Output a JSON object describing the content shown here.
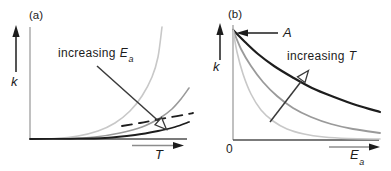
{
  "colors": {
    "light_curve": "#c8c8c8",
    "mid_curve": "#9a9a9a",
    "dark_curve": "#1d1d1d",
    "y_axis": "#9e9e9e",
    "x_axis": "#4f4f4f",
    "indicator": "#1d1d1d",
    "guide_shaft": "#8c8c8c",
    "annotation_arrow": "#3a3a3a",
    "text": "#1c1c1c",
    "background": "#ffffff"
  },
  "panel_a": {
    "tag": "(a)",
    "y_axis_label": "k",
    "x_axis_label": "T",
    "annotation": {
      "text": "increasing",
      "symbol": "E",
      "subscript": "a"
    }
  },
  "panel_b": {
    "tag": "(b)",
    "y_axis_label": "k",
    "x_axis_label": "E",
    "x_axis_subscript": "a",
    "origin_label": "0",
    "intercept_label": "A",
    "annotation": {
      "text": "increasing",
      "symbol": "T"
    }
  },
  "chart_data": [
    {
      "type": "line",
      "panel": "(a)",
      "title": "rate constant k versus temperature T for different activation energies",
      "xlabel": "T",
      "ylabel": "k",
      "numeric_axes": false,
      "annotation": "increasing Ea (arrow toward flatter curves)",
      "legend": "none",
      "series": [
        {
          "name": "smallest Ea",
          "color": "light",
          "width": 1.6,
          "dashed": false,
          "points": [
            [
              30,
              139
            ],
            [
              55,
              138.5
            ],
            [
              78,
              136
            ],
            [
              98,
              131
            ],
            [
              115,
              123
            ],
            [
              130,
              111
            ],
            [
              142,
              96
            ],
            [
              152,
              77
            ],
            [
              158,
              57
            ],
            [
              162,
              27
            ]
          ]
        },
        {
          "name": "medium Ea",
          "color": "mid",
          "width": 1.6,
          "dashed": false,
          "points": [
            [
              30,
              139
            ],
            [
              65,
              138.6
            ],
            [
              95,
              137
            ],
            [
              120,
              133
            ],
            [
              142,
              127
            ],
            [
              160,
              118
            ],
            [
              172,
              109
            ],
            [
              181,
              99
            ],
            [
              189,
              88
            ]
          ]
        },
        {
          "name": "large Ea",
          "color": "dark",
          "width": 1.8,
          "dashed": false,
          "points": [
            [
              30,
              139
            ],
            [
              70,
              138.8
            ],
            [
              105,
              138
            ],
            [
              135,
              135
            ],
            [
              158,
              131
            ],
            [
              175,
              127
            ],
            [
              189,
              122
            ]
          ]
        },
        {
          "name": "largest Ea dashed",
          "color": "dark",
          "width": 1.8,
          "dashed": true,
          "points": [
            [
              122,
              126
            ],
            [
              140,
              123
            ],
            [
              158,
              119.5
            ],
            [
              172,
              117
            ],
            [
              186,
              114.5
            ],
            [
              193,
              113
            ]
          ]
        }
      ]
    },
    {
      "type": "line",
      "panel": "(b)",
      "title": "rate constant k versus activation energy Ea at different temperatures; all curves start at pre-exponential factor A",
      "xlabel": "Ea",
      "ylabel": "k",
      "numeric_axes": false,
      "origin_tick": "0",
      "intercept": "A",
      "annotation": "increasing T (arrow toward higher curves)",
      "legend": "none",
      "series": [
        {
          "name": "highest T",
          "color": "dark",
          "width": 2.2,
          "dashed": false,
          "points": [
            [
              233,
              30
            ],
            [
              245,
              42
            ],
            [
              258,
              54
            ],
            [
              274,
              66
            ],
            [
              292,
              77
            ],
            [
              312,
              88
            ],
            [
              334,
              97
            ],
            [
              356,
              105
            ],
            [
              380,
              112
            ]
          ]
        },
        {
          "name": "medium T",
          "color": "mid",
          "width": 1.8,
          "dashed": false,
          "points": [
            [
              233,
              30
            ],
            [
              241,
              49
            ],
            [
              251,
              66
            ],
            [
              263,
              82
            ],
            [
              277,
              96
            ],
            [
              293,
              108
            ],
            [
              311,
              117
            ],
            [
              331,
              124
            ],
            [
              353,
              129
            ],
            [
              380,
              133
            ]
          ]
        },
        {
          "name": "lowest T",
          "color": "light",
          "width": 1.6,
          "dashed": false,
          "points": [
            [
              233,
              30
            ],
            [
              237,
              52
            ],
            [
              243,
              74
            ],
            [
              251,
              94
            ],
            [
              261,
              110
            ],
            [
              273,
              121
            ],
            [
              287,
              129
            ],
            [
              304,
              134
            ],
            [
              324,
              137
            ],
            [
              348,
              138.5
            ],
            [
              380,
              139
            ]
          ]
        }
      ]
    }
  ]
}
